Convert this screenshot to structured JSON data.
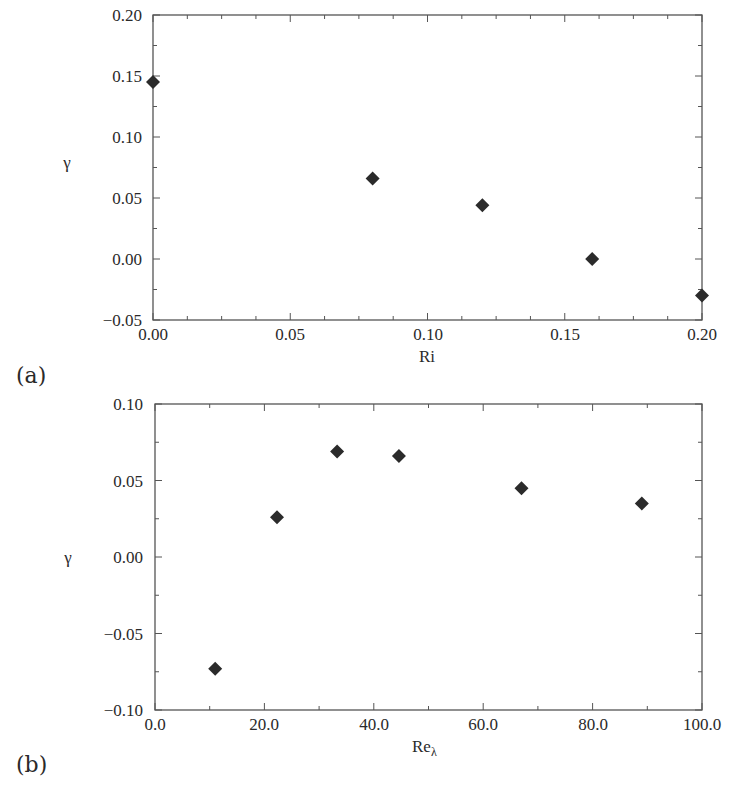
{
  "chart_data": [
    {
      "panel": "(a)",
      "type": "scatter",
      "title": "",
      "xlabel": "Ri",
      "ylabel": "γ",
      "xlim": [
        0.0,
        0.2
      ],
      "ylim": [
        -0.05,
        0.2
      ],
      "xticks": [
        "0.00",
        "0.05",
        "0.10",
        "0.15",
        "0.20"
      ],
      "yticks": [
        "-0.05",
        "0.00",
        "0.05",
        "0.10",
        "0.15",
        "0.20"
      ],
      "grid": false,
      "marker": "diamond",
      "series": [
        {
          "name": "γ vs Ri",
          "x": [
            0.0,
            0.08,
            0.12,
            0.16,
            0.2
          ],
          "y": [
            0.145,
            0.066,
            0.044,
            0.0,
            -0.03
          ]
        }
      ]
    },
    {
      "panel": "(b)",
      "type": "scatter",
      "title": "",
      "xlabel": "Reλ",
      "ylabel": "γ",
      "xlim": [
        0.0,
        100.0
      ],
      "ylim": [
        -0.1,
        0.1
      ],
      "xticks": [
        "0.0",
        "20.0",
        "40.0",
        "60.0",
        "80.0",
        "100.0"
      ],
      "yticks": [
        "-0.10",
        "-0.05",
        "0.00",
        "0.05",
        "0.10"
      ],
      "grid": false,
      "marker": "diamond",
      "series": [
        {
          "name": "γ vs Reλ",
          "x": [
            11.0,
            22.3,
            33.3,
            44.6,
            67.0,
            89.0
          ],
          "y": [
            -0.073,
            0.026,
            0.069,
            0.066,
            0.045,
            0.035
          ]
        }
      ]
    }
  ],
  "panels": {
    "a": {
      "label": "(a)",
      "xlabel": "Ri",
      "ylabel": "γ",
      "yticks": [
        "0.20",
        "0.15",
        "0.10",
        "0.05",
        "0.00",
        "−0.05"
      ],
      "xticks": [
        "0.00",
        "0.05",
        "0.10",
        "0.15",
        "0.20"
      ]
    },
    "b": {
      "label": "(b)",
      "xlabel_main": "Re",
      "xlabel_sub": "λ",
      "ylabel": "γ",
      "yticks": [
        "0.10",
        "0.05",
        "0.00",
        "−0.05",
        "−0.10"
      ],
      "xticks": [
        "0.0",
        "20.0",
        "40.0",
        "60.0",
        "80.0",
        "100.0"
      ]
    }
  },
  "colors": {
    "axis": "#555555",
    "marker": "#2b2b2b",
    "text": "#2a2a2a"
  }
}
